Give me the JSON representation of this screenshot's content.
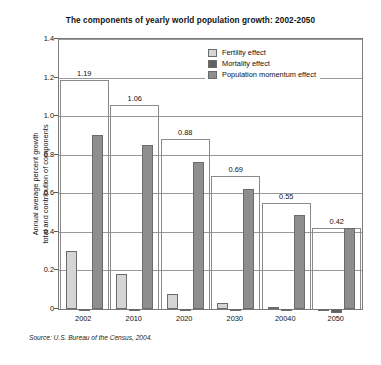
{
  "chart_data": {
    "type": "bar",
    "title": "The components of yearly world population growth: 2002-2050",
    "xlabel": "",
    "ylabel": "Annual average percent growth total and contribution of components",
    "ylabel_line1": "Annual average percent growth",
    "ylabel_line2": "total and contribution of components",
    "categories": [
      "2002",
      "2010",
      "2020",
      "2030",
      "20040",
      "2050"
    ],
    "ylim": [
      0,
      1.4
    ],
    "yticks": [
      "0",
      "0.2",
      "0.4",
      "0.6",
      "0.8",
      "1.0",
      "1.2",
      "1.4"
    ],
    "ytick_values": [
      0,
      0.2,
      0.4,
      0.6,
      0.8,
      1.0,
      1.2,
      1.4
    ],
    "grid": true,
    "legend_position": "top-right inside",
    "series": [
      {
        "name": "Fertility effect",
        "color": "#d5d5d5",
        "values": [
          0.3,
          0.18,
          0.08,
          0.03,
          0.01,
          0.0
        ]
      },
      {
        "name": "Mortality effect",
        "color": "#616161",
        "values": [
          -0.01,
          -0.01,
          -0.01,
          -0.01,
          -0.01,
          -0.02
        ]
      },
      {
        "name": "Population momentum effect",
        "color": "#8e8e8e",
        "values": [
          0.9,
          0.85,
          0.76,
          0.62,
          0.49,
          0.42
        ]
      }
    ],
    "totals": {
      "name": "Total growth",
      "labels": [
        "1.19",
        "1.06",
        "0.88",
        "0.69",
        "0.55",
        "0.42"
      ],
      "values": [
        1.19,
        1.06,
        0.88,
        0.69,
        0.55,
        0.42
      ]
    },
    "annotations": [
      "Source: U.S. Bureau of the Census, 2004."
    ]
  },
  "legend": {
    "items": [
      {
        "label": "Fertility effect",
        "swatch": "fertility"
      },
      {
        "label": "Mortality effect",
        "swatch": "mortality"
      },
      {
        "label": "Population momentum effect",
        "swatch": "momentum"
      }
    ]
  },
  "source": {
    "text": "Source: U.S. Bureau of the Census, 2004."
  }
}
